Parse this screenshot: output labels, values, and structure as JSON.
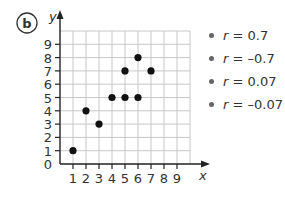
{
  "label": "b",
  "chart_data": {
    "type": "scatter",
    "title": "",
    "xlabel": "x",
    "ylabel": "y",
    "xlim": [
      0,
      10
    ],
    "ylim": [
      0,
      10
    ],
    "grid": true,
    "x_ticks": [
      "1",
      "2",
      "3",
      "4",
      "5",
      "6",
      "7",
      "8",
      "9"
    ],
    "y_ticks": [
      "0",
      "1",
      "2",
      "3",
      "4",
      "5",
      "6",
      "7",
      "8",
      "9"
    ],
    "points": [
      {
        "x": 1,
        "y": 1
      },
      {
        "x": 2,
        "y": 4
      },
      {
        "x": 3,
        "y": 3
      },
      {
        "x": 4,
        "y": 5
      },
      {
        "x": 5,
        "y": 5
      },
      {
        "x": 5,
        "y": 7
      },
      {
        "x": 6,
        "y": 5
      },
      {
        "x": 6,
        "y": 8
      },
      {
        "x": 7,
        "y": 7
      }
    ],
    "legend_position": "right"
  },
  "options": [
    {
      "var": "r",
      "eq": " = ",
      "value": "0.7"
    },
    {
      "var": "r",
      "eq": " = ",
      "value": "–0.7"
    },
    {
      "var": "r",
      "eq": " = ",
      "value": "0.07"
    },
    {
      "var": "r",
      "eq": " = ",
      "value": "–0.07"
    }
  ]
}
